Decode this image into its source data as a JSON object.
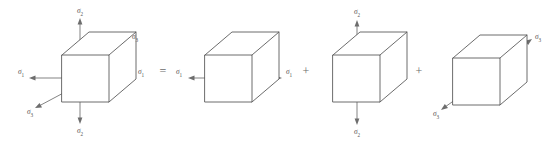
{
  "figure": {
    "width": 551,
    "height": 141,
    "background_color": "#ffffff",
    "edge_color": "#5b5b5b",
    "arrow_color": "#6d6d6d",
    "label_color": "#555555"
  },
  "symbols": {
    "sigma": "σ",
    "equals": "=",
    "plus": "+"
  },
  "operators": [
    {
      "id": "equals-sign",
      "symbol": "=",
      "x": 162,
      "y": 71
    },
    {
      "id": "plus-sign-1",
      "symbol": "+",
      "x": 306,
      "y": 71
    },
    {
      "id": "plus-sign-2",
      "symbol": "+",
      "x": 419,
      "y": 71
    }
  ],
  "cubes": [
    {
      "id": "triaxial-cube",
      "name": "triaxial-stress-cube",
      "order": 1,
      "front_left": 62,
      "front_top": 55,
      "face_size": 47,
      "depth_dx": 27,
      "depth_dy": -23,
      "labels": [
        {
          "id": "sigma-2-top",
          "base": "σ",
          "sub": "2",
          "x": 80,
          "y": 10
        },
        {
          "id": "sigma-2-bottom",
          "base": "σ",
          "sub": "2",
          "x": 80,
          "y": 130
        },
        {
          "id": "sigma-1-left",
          "base": "σ",
          "sub": "1",
          "x": 21,
          "y": 71
        },
        {
          "id": "sigma-1-right",
          "base": "σ",
          "sub": "1",
          "x": 140,
          "y": 71
        },
        {
          "id": "sigma-3-upper",
          "base": "σ",
          "sub": "3",
          "x": 133,
          "y": 38
        },
        {
          "id": "sigma-3-lower",
          "base": "σ",
          "sub": "3",
          "x": 31,
          "y": 110
        }
      ],
      "stresses": [
        "σ₁",
        "σ₂",
        "σ₃"
      ]
    },
    {
      "id": "sigma1-cube",
      "name": "uniaxial-sigma1-cube",
      "order": 2,
      "front_left": 205,
      "front_top": 55,
      "face_size": 47,
      "depth_dx": 27,
      "depth_dy": -23,
      "labels": [
        {
          "id": "sigma-1-left",
          "base": "σ",
          "sub": "1",
          "x": 180,
          "y": 71
        },
        {
          "id": "sigma-1-right",
          "base": "σ",
          "sub": "1",
          "x": 288,
          "y": 71
        }
      ],
      "stresses": [
        "σ₁"
      ]
    },
    {
      "id": "sigma2-cube",
      "name": "uniaxial-sigma2-cube",
      "order": 3,
      "front_left": 333,
      "front_top": 55,
      "face_size": 47,
      "depth_dx": 27,
      "depth_dy": -23,
      "labels": [
        {
          "id": "sigma-2-top",
          "base": "σ",
          "sub": "2",
          "x": 357,
          "y": 11
        },
        {
          "id": "sigma-2-bottom",
          "base": "σ",
          "sub": "2",
          "x": 357,
          "y": 131
        }
      ],
      "stresses": [
        "σ₂"
      ]
    },
    {
      "id": "sigma3-cube",
      "name": "uniaxial-sigma3-cube",
      "order": 4,
      "front_left": 453,
      "front_top": 58,
      "face_size": 47,
      "depth_dx": 27,
      "depth_dy": -23,
      "labels": [
        {
          "id": "sigma-3-upper",
          "base": "σ",
          "sub": "3",
          "x": 536,
          "y": 38
        },
        {
          "id": "sigma-3-lower",
          "base": "σ",
          "sub": "3",
          "x": 437,
          "y": 112
        }
      ],
      "stresses": [
        "σ₃"
      ]
    }
  ],
  "equation_text": "σ₁,σ₂,σ₃ = σ₁ + σ₂ + σ₃"
}
